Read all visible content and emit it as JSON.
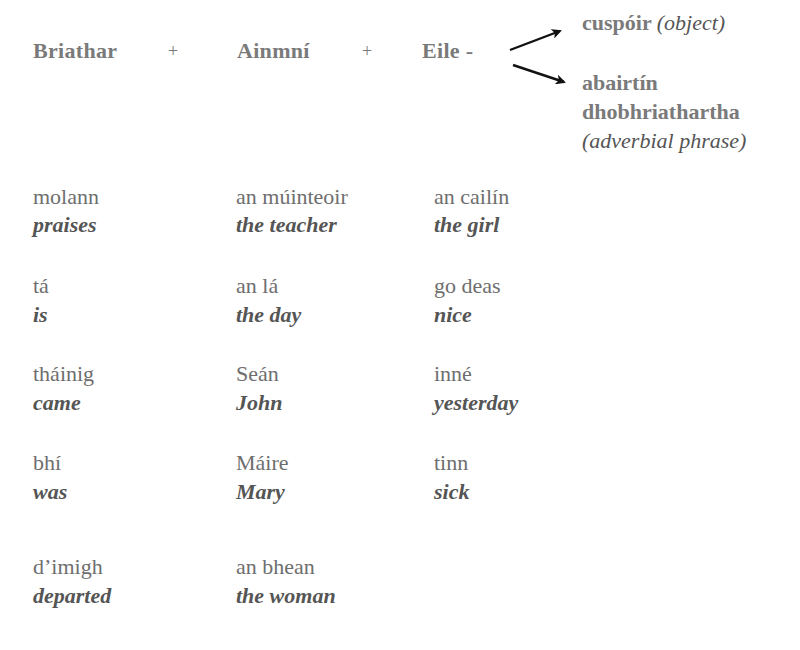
{
  "header": {
    "col1": "Briathar",
    "plus1": "+",
    "col2": "Ainmní",
    "plus2": "+",
    "col3": "Eile -"
  },
  "branches": {
    "object": {
      "irish": "cuspóir",
      "english": "(object)"
    },
    "adverbial": {
      "irish_line1": "abairtín",
      "irish_line2": "dhobhriathartha",
      "english": "(adverbial phrase)"
    },
    "arrow_color": "#111111"
  },
  "rows": [
    {
      "verb": {
        "irish": "molann",
        "english": "praises"
      },
      "subject": {
        "irish": "an múinteoir",
        "english": "the teacher"
      },
      "other": {
        "irish": "an cailín",
        "english": "the girl"
      }
    },
    {
      "verb": {
        "irish": "tá",
        "english": "is"
      },
      "subject": {
        "irish": "an lá",
        "english": "the day"
      },
      "other": {
        "irish": "go deas",
        "english": "nice"
      }
    },
    {
      "verb": {
        "irish": "tháinig",
        "english": "came"
      },
      "subject": {
        "irish": "Seán",
        "english": "John"
      },
      "other": {
        "irish": "inné",
        "english": "yesterday"
      }
    },
    {
      "verb": {
        "irish": "bhí",
        "english": "was"
      },
      "subject": {
        "irish": "Máire",
        "english": "Mary"
      },
      "other": {
        "irish": "tinn",
        "english": "sick"
      }
    },
    {
      "verb": {
        "irish": "d’imigh",
        "english": "departed"
      },
      "subject": {
        "irish": "an bhean",
        "english": "the woman"
      },
      "other": {
        "irish": "",
        "english": ""
      }
    }
  ],
  "colors": {
    "text": "#6e6e6e",
    "translation": "#555555",
    "background": "#ffffff"
  }
}
